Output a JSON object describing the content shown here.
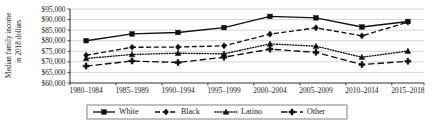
{
  "chart_data": {
    "type": "line",
    "title": "",
    "xlabel": "",
    "ylabel": "Median family income in 2018 dollars",
    "ylabel_line1": "Median family income",
    "ylabel_line2": "in 2018 dollars",
    "categories": [
      "1980–1984",
      "1985–1989",
      "1990–1994",
      "1995–1999",
      "2000–2004",
      "2005–2009",
      "2010–2014",
      "2015–2018"
    ],
    "ylim": [
      60000,
      95000
    ],
    "ytick_values": [
      60000,
      65000,
      70000,
      75000,
      80000,
      85000,
      90000,
      95000
    ],
    "ytick_labels": [
      "$60,000",
      "$65,000",
      "$70,000",
      "$75,000",
      "$80,000",
      "$85,000",
      "$90,000",
      "$95,000"
    ],
    "grid": true,
    "legend_position": "bottom",
    "series": [
      {
        "name": "White",
        "marker": "square",
        "dash": "solid",
        "values": [
          80000,
          83200,
          83900,
          86200,
          91500,
          90800,
          86500,
          89100
        ]
      },
      {
        "name": "Black",
        "marker": "diamond",
        "dash": "dashed",
        "values": [
          73100,
          76900,
          77000,
          77600,
          83100,
          86100,
          82300,
          88800
        ]
      },
      {
        "name": "Latino",
        "marker": "triangle",
        "dash": "dotted",
        "values": [
          71600,
          73500,
          74100,
          73800,
          78500,
          77400,
          72200,
          75100
        ]
      },
      {
        "name": "Other",
        "marker": "cross",
        "dash": "longdash",
        "values": [
          68000,
          70400,
          69700,
          72200,
          76000,
          74500,
          68700,
          70300
        ]
      }
    ]
  },
  "legend": {
    "items": [
      {
        "label": "White"
      },
      {
        "label": "Black"
      },
      {
        "label": "Latino"
      },
      {
        "label": "Other"
      }
    ]
  },
  "colors": {
    "line": "#111111",
    "grid": "#b8b8b8",
    "axis": "#1a1a1a",
    "background": "#ffffff"
  }
}
